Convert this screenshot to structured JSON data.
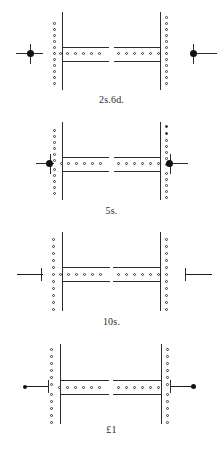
{
  "plate": {
    "title": "Perforation and marginal-marking diagrams",
    "background_color": "#ffffff",
    "ink_color": "#2b2b2b",
    "width": 223,
    "height": 453
  },
  "rows": [
    {
      "id": "row-2s6d",
      "caption": "2s.6d.",
      "left_marker": "cross-dot-detached",
      "right_marker": "cross-dot-detached",
      "left_column_perfs": 13,
      "right_column_perfs": 14,
      "left_row_perfs": 6,
      "right_row_perfs": 6,
      "filled_perfs": "none"
    },
    {
      "id": "row-5s",
      "caption": "5s.",
      "left_marker": "cross-dot-attached",
      "right_marker": "cross-dot-attached",
      "left_column_perfs": 13,
      "right_column_perfs": 14,
      "left_row_perfs": 6,
      "right_row_perfs": 6,
      "filled_perfs": "right-top-two"
    },
    {
      "id": "row-10s",
      "caption": "10s.",
      "left_marker": "bar-with-tick",
      "right_marker": "bar-with-tick",
      "left_column_perfs": 13,
      "right_column_perfs": 13,
      "left_row_perfs": 6,
      "right_row_perfs": 6,
      "filled_perfs": "none"
    },
    {
      "id": "row-pound1",
      "caption": "£1",
      "left_marker": "dot-lead-to-cross",
      "right_marker": "dot-lead-to-cross",
      "left_column_perfs": 13,
      "right_column_perfs": 13,
      "left_row_perfs": 6,
      "right_row_perfs": 6,
      "filled_perfs": "none"
    }
  ],
  "legend": {
    "perforation_hole": "perforation-hole-icon",
    "marker_dot": "marker-dot-icon",
    "registration_cross": "registration-cross-icon"
  }
}
